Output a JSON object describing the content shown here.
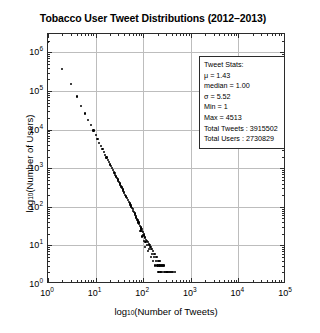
{
  "chart_data": {
    "type": "scatter",
    "title": "Tobacco User Tweet Distributions (2012–2013)",
    "xlabel": "log10(Number of Tweets)",
    "ylabel": "log10(Number of Users)",
    "xscale": "log",
    "yscale": "log",
    "xlim": [
      1,
      100000
    ],
    "ylim": [
      1,
      3000000
    ],
    "grid": true,
    "legend": "none",
    "xticklabels": [
      "10^0",
      "10^1",
      "10^2",
      "10^3",
      "10^4",
      "10^5"
    ],
    "yticklabels": [
      "10^0",
      "10^1",
      "10^2",
      "10^3",
      "10^4",
      "10^5",
      "10^6"
    ],
    "xtick_values": [
      1,
      10,
      100,
      1000,
      10000,
      100000
    ],
    "ytick_values": [
      1,
      10,
      100,
      1000,
      10000,
      100000,
      1000000
    ],
    "series": [
      {
        "name": "Tobacco user tweet frequency distribution",
        "marker": "dot",
        "color": "#000000",
        "points": [
          [
            1,
            1900000
          ],
          [
            2,
            380000
          ],
          [
            3,
            150000
          ],
          [
            4,
            72000
          ],
          [
            5,
            41000
          ],
          [
            6,
            26000
          ],
          [
            7,
            18000
          ],
          [
            8,
            13000
          ],
          [
            9,
            9500
          ],
          [
            10,
            7200
          ],
          [
            11,
            5600
          ],
          [
            12,
            4500
          ],
          [
            13,
            3700
          ],
          [
            14,
            3100
          ],
          [
            15,
            2600
          ],
          [
            16,
            2200
          ],
          [
            17,
            1900
          ],
          [
            18,
            1650
          ],
          [
            19,
            1450
          ],
          [
            20,
            1250
          ],
          [
            21,
            1120
          ],
          [
            22,
            1000
          ],
          [
            23,
            900
          ],
          [
            24,
            810
          ],
          [
            25,
            740
          ],
          [
            26,
            670
          ],
          [
            27,
            610
          ],
          [
            28,
            560
          ],
          [
            29,
            510
          ],
          [
            30,
            470
          ],
          [
            31,
            430
          ],
          [
            32,
            400
          ],
          [
            33,
            370
          ],
          [
            34,
            345
          ],
          [
            35,
            320
          ],
          [
            36,
            300
          ],
          [
            37,
            280
          ],
          [
            38,
            260
          ],
          [
            39,
            245
          ],
          [
            40,
            230
          ],
          [
            42,
            205
          ],
          [
            44,
            185
          ],
          [
            46,
            165
          ],
          [
            48,
            148
          ],
          [
            50,
            135
          ],
          [
            52,
            122
          ],
          [
            54,
            112
          ],
          [
            56,
            102
          ],
          [
            58,
            94
          ],
          [
            60,
            86
          ],
          [
            62,
            79
          ],
          [
            64,
            73
          ],
          [
            66,
            67
          ],
          [
            68,
            62
          ],
          [
            70,
            57
          ],
          [
            72,
            53
          ],
          [
            74,
            49
          ],
          [
            76,
            45
          ],
          [
            78,
            42
          ],
          [
            80,
            39
          ],
          [
            83,
            35
          ],
          [
            86,
            32
          ],
          [
            89,
            29
          ],
          [
            92,
            26
          ],
          [
            95,
            24
          ],
          [
            98,
            22
          ],
          [
            102,
            20
          ],
          [
            106,
            18
          ],
          [
            110,
            16
          ],
          [
            115,
            14
          ],
          [
            120,
            13
          ],
          [
            125,
            12
          ],
          [
            130,
            11
          ],
          [
            136,
            10
          ],
          [
            142,
            9
          ],
          [
            148,
            8
          ],
          [
            155,
            8
          ],
          [
            162,
            7
          ],
          [
            170,
            6
          ],
          [
            178,
            6
          ],
          [
            186,
            5
          ],
          [
            195,
            5
          ],
          [
            205,
            4
          ],
          [
            215,
            4
          ],
          [
            226,
            4
          ],
          [
            238,
            3
          ],
          [
            250,
            3
          ],
          [
            263,
            3
          ],
          [
            277,
            3
          ],
          [
            292,
            2
          ],
          [
            308,
            2
          ],
          [
            324,
            2
          ],
          [
            342,
            2
          ],
          [
            360,
            2
          ],
          [
            380,
            2
          ],
          [
            400,
            2
          ],
          [
            422,
            2
          ],
          [
            445,
            1
          ],
          [
            470,
            2
          ],
          [
            495,
            1
          ],
          [
            522,
            1
          ],
          [
            550,
            1
          ],
          [
            580,
            1
          ],
          [
            612,
            1
          ],
          [
            645,
            1
          ],
          [
            680,
            1
          ],
          [
            717,
            1
          ],
          [
            756,
            1
          ],
          [
            797,
            1
          ],
          [
            840,
            1
          ],
          [
            886,
            1
          ],
          [
            934,
            1
          ],
          [
            985,
            1
          ],
          [
            1040,
            1
          ],
          [
            1096,
            1
          ],
          [
            1156,
            1
          ],
          [
            1219,
            1
          ],
          [
            1285,
            1
          ],
          [
            1355,
            1
          ],
          [
            1429,
            1
          ],
          [
            1507,
            1
          ],
          [
            1589,
            1
          ],
          [
            1676,
            1
          ],
          [
            1767,
            1
          ],
          [
            1864,
            1
          ],
          [
            1966,
            1
          ],
          [
            2073,
            1
          ],
          [
            2186,
            1
          ],
          [
            2305,
            1
          ],
          [
            2431,
            1
          ],
          [
            2563,
            1
          ],
          [
            2703,
            1
          ],
          [
            2850,
            1
          ],
          [
            3006,
            1
          ],
          [
            3170,
            1
          ],
          [
            3343,
            1
          ],
          [
            3525,
            1
          ],
          [
            3717,
            1
          ],
          [
            3920,
            1
          ],
          [
            4134,
            1
          ],
          [
            4359,
            1
          ],
          [
            4513,
            1
          ],
          [
            110,
            9
          ],
          [
            118,
            10
          ],
          [
            126,
            7
          ],
          [
            134,
            8
          ],
          [
            104,
            13
          ],
          [
            112,
            12
          ],
          [
            96,
            17
          ],
          [
            99,
            19
          ],
          [
            88,
            24
          ],
          [
            91,
            27
          ],
          [
            145,
            5
          ],
          [
            152,
            6
          ],
          [
            160,
            4
          ],
          [
            168,
            5
          ],
          [
            176,
            3
          ],
          [
            184,
            4
          ],
          [
            200,
            3
          ],
          [
            210,
            2
          ],
          [
            220,
            3
          ],
          [
            232,
            2
          ],
          [
            244,
            2
          ],
          [
            256,
            1
          ],
          [
            270,
            2
          ],
          [
            285,
            1
          ],
          [
            300,
            1
          ],
          [
            316,
            2
          ],
          [
            333,
            1
          ],
          [
            351,
            1
          ],
          [
            370,
            1
          ],
          [
            390,
            1
          ],
          [
            410,
            1
          ],
          [
            432,
            1
          ],
          [
            455,
            1
          ],
          [
            480,
            1
          ],
          [
            506,
            1
          ],
          [
            533,
            1
          ],
          [
            562,
            1
          ],
          [
            592,
            1
          ],
          [
            624,
            1
          ],
          [
            658,
            1
          ],
          [
            693,
            1
          ],
          [
            730,
            1
          ],
          [
            770,
            1
          ],
          [
            811,
            1
          ],
          [
            855,
            1
          ],
          [
            901,
            1
          ],
          [
            950,
            1
          ],
          [
            1001,
            1
          ],
          [
            1055,
            1
          ],
          [
            1112,
            1
          ],
          [
            1172,
            1
          ],
          [
            1235,
            1
          ],
          [
            1302,
            1
          ],
          [
            1372,
            1
          ],
          [
            1446,
            1
          ],
          [
            1524,
            1
          ],
          [
            1606,
            1
          ],
          [
            1693,
            1
          ],
          [
            1784,
            1
          ],
          [
            1880,
            1
          ],
          [
            2000,
            1
          ],
          [
            2120,
            1
          ],
          [
            2250,
            1
          ],
          [
            2400,
            1
          ],
          [
            2600,
            1
          ],
          [
            2800,
            1
          ],
          [
            3050,
            1
          ],
          [
            3300,
            1
          ],
          [
            3600,
            1
          ],
          [
            4000,
            1
          ]
        ]
      }
    ],
    "annotation": {
      "title": "Tweet Stats:",
      "lines": [
        "μ = 1.43",
        "median = 1.00",
        "σ = 5.52",
        "Min = 1",
        "Max = 4513",
        "Total Tweets : 3915502",
        "Total Users : 2730829"
      ]
    }
  },
  "colors": {
    "background": "#ffffff",
    "axis": "#2b2b2b",
    "grid": "#bdbdbd",
    "marker": "#000000"
  }
}
